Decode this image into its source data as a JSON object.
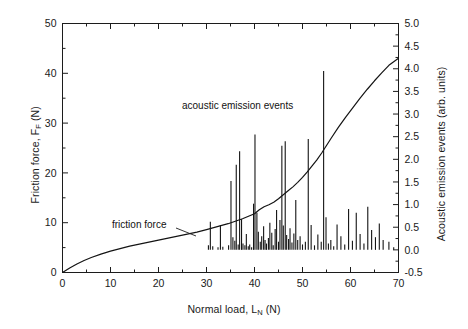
{
  "chart_data": {
    "type": "line",
    "title": "",
    "xlabel": "Normal load, L_N (N)",
    "xlabel_text": "Normal load, L",
    "xlabel_sub": "N",
    "xlabel_unit": " (N)",
    "ylabel_left_text": "Friction force, F",
    "ylabel_left_sub": "F",
    "ylabel_left_unit": " (N)",
    "ylabel_right": "Acoustic emission events (arb. units)",
    "xlim": [
      0,
      70
    ],
    "ylim_left": [
      0,
      50
    ],
    "ylim_right": [
      -0.5,
      5.0
    ],
    "xticks": [
      0,
      10,
      20,
      30,
      40,
      50,
      60,
      70
    ],
    "xticklabels": [
      "0",
      "10",
      "20",
      "30",
      "40",
      "50",
      "60",
      "70"
    ],
    "yticks_left": [
      0,
      10,
      20,
      30,
      40,
      50
    ],
    "yticklabels_left": [
      "0",
      "10",
      "20",
      "30",
      "40",
      "50"
    ],
    "yticks_right": [
      -0.5,
      0.0,
      0.5,
      1.0,
      1.5,
      2.0,
      2.5,
      3.0,
      3.5,
      4.0,
      4.5,
      5.0
    ],
    "yticklabels_right": [
      "-0.5",
      "0.0",
      "0.5",
      "1.0",
      "1.5",
      "2.0",
      "2.5",
      "3.0",
      "3.5",
      "4.0",
      "4.5",
      "5.0"
    ],
    "grid": false,
    "minor_ticks": true,
    "annotations": [
      {
        "name": "acoustic-emission-label",
        "text": "acoustic emission events",
        "x": 32.5,
        "y_left": 31.5
      },
      {
        "name": "friction-force-label",
        "text": "friction force",
        "x": 13.5,
        "y_left": 8.2
      }
    ],
    "series": [
      {
        "name": "friction force",
        "type": "line",
        "axis": "left",
        "color": "#141414",
        "x": [
          0.0,
          1.5,
          3.0,
          4.5,
          6.0,
          8.0,
          10.0,
          12.0,
          14.0,
          16.0,
          18.0,
          20.0,
          22.0,
          24.0,
          26.0,
          28.0,
          30.0,
          31.5,
          33.0,
          34.5,
          36.0,
          37.5,
          39.0,
          40.0,
          41.0,
          42.0,
          43.0,
          44.0,
          45.0,
          46.0,
          47.0,
          48.0,
          49.0,
          50.0,
          51.0,
          52.0,
          53.0,
          54.0,
          55.0,
          56.0,
          57.5,
          59.0,
          60.5,
          62.0,
          63.5,
          65.0,
          66.5,
          68.0,
          69.0,
          70.0
        ],
        "y": [
          0.0,
          0.9,
          1.7,
          2.4,
          3.0,
          3.7,
          4.3,
          4.8,
          5.3,
          5.7,
          6.1,
          6.5,
          6.9,
          7.3,
          7.7,
          8.1,
          8.6,
          9.0,
          9.4,
          9.8,
          10.3,
          10.8,
          11.4,
          11.8,
          12.6,
          13.2,
          13.6,
          14.1,
          14.8,
          15.6,
          16.4,
          17.2,
          18.1,
          19.1,
          20.2,
          21.4,
          22.6,
          24.0,
          25.5,
          27.0,
          29.2,
          31.2,
          33.1,
          35.0,
          36.8,
          38.5,
          40.1,
          41.6,
          42.3,
          43.0
        ]
      },
      {
        "name": "acoustic emission events",
        "type": "impulse",
        "axis": "right",
        "color": "#141414",
        "x": [
          30.4,
          30.8,
          31.3,
          32.4,
          32.9,
          33.4,
          34.6,
          35.1,
          35.5,
          35.9,
          36.2,
          36.6,
          36.9,
          37.3,
          37.6,
          38.0,
          38.3,
          38.7,
          39.0,
          39.4,
          39.8,
          40.1,
          40.5,
          40.8,
          41.2,
          41.5,
          41.9,
          42.2,
          42.5,
          42.9,
          43.2,
          43.6,
          43.9,
          44.3,
          44.6,
          45.0,
          45.3,
          45.7,
          46.0,
          46.4,
          46.7,
          47.1,
          47.4,
          47.8,
          48.2,
          48.6,
          49.0,
          49.5,
          50.0,
          50.6,
          51.2,
          51.8,
          52.5,
          53.2,
          53.9,
          54.4,
          54.9,
          55.4,
          55.9,
          56.5,
          57.2,
          58.0,
          58.8,
          59.6,
          60.4,
          61.2,
          62.0,
          62.8,
          63.6,
          64.4,
          65.2,
          66.0,
          66.8,
          68.0,
          69.0
        ],
        "y": [
          0.1,
          0.62,
          0.08,
          0.06,
          0.55,
          0.07,
          0.1,
          1.52,
          0.28,
          0.2,
          1.88,
          0.12,
          2.18,
          0.68,
          0.14,
          0.1,
          0.35,
          0.08,
          0.12,
          0.06,
          1.02,
          2.55,
          0.82,
          0.4,
          0.18,
          0.3,
          0.52,
          0.22,
          0.14,
          0.26,
          0.6,
          0.38,
          0.1,
          0.46,
          0.88,
          0.18,
          0.66,
          2.3,
          0.54,
          2.4,
          0.33,
          0.24,
          0.48,
          0.16,
          0.36,
          1.1,
          0.22,
          0.3,
          0.12,
          0.18,
          2.45,
          0.55,
          0.1,
          0.34,
          0.18,
          3.95,
          0.72,
          0.14,
          0.22,
          0.08,
          0.56,
          0.3,
          0.12,
          0.9,
          0.2,
          0.82,
          0.35,
          0.14,
          0.95,
          0.44,
          0.28,
          0.58,
          0.22,
          0.18,
          0.06
        ]
      }
    ]
  }
}
